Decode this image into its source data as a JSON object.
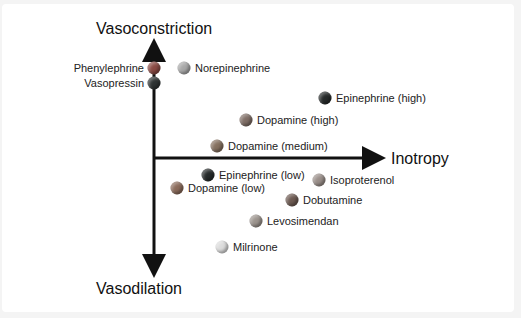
{
  "axes": {
    "top": "Vasoconstriction",
    "bottom": "Vasodilation",
    "right": "Inotropy"
  },
  "chart_data": {
    "type": "scatter",
    "title": "",
    "xlabel": "Inotropy",
    "ylabel_top": "Vasoconstriction",
    "ylabel_bottom": "Vasodilation",
    "points": [
      {
        "name": "Phenylephrine",
        "x": 154,
        "y": 68,
        "color": "#8a4a44",
        "label_side": "left"
      },
      {
        "name": "Vasopressin",
        "x": 154,
        "y": 83,
        "color": "#2f3434",
        "label_side": "left"
      },
      {
        "name": "Norepinephrine",
        "x": 184,
        "y": 68,
        "color": "#a8a8a8",
        "label_side": "right"
      },
      {
        "name": "Epinephrine (high)",
        "x": 325,
        "y": 98,
        "color": "#262a2a",
        "label_side": "right"
      },
      {
        "name": "Dopamine (high)",
        "x": 246,
        "y": 120,
        "color": "#7f6e66",
        "label_side": "right"
      },
      {
        "name": "Dopamine (medium)",
        "x": 217,
        "y": 146,
        "color": "#85705f",
        "label_side": "right"
      },
      {
        "name": "Epinephrine (low)",
        "x": 208,
        "y": 175,
        "color": "#262a2a",
        "label_side": "right"
      },
      {
        "name": "Dopamine (low)",
        "x": 177,
        "y": 188,
        "color": "#8a6a5a",
        "label_side": "right"
      },
      {
        "name": "Isoproterenol",
        "x": 319,
        "y": 180,
        "color": "#9a8f8a",
        "label_side": "right"
      },
      {
        "name": "Dobutamine",
        "x": 292,
        "y": 200,
        "color": "#6d5a52",
        "label_side": "right"
      },
      {
        "name": "Levosimendan",
        "x": 256,
        "y": 221,
        "color": "#9c948e",
        "label_side": "right"
      },
      {
        "name": "Milrinone",
        "x": 222,
        "y": 247,
        "color": "#dcdcdc",
        "label_side": "right"
      }
    ]
  }
}
